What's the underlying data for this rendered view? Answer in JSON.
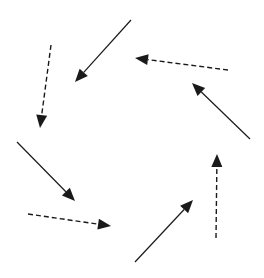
{
  "diagram": {
    "type": "rotational-arrow-field",
    "width": 264,
    "height": 278,
    "stroke_color": "#1a1a1a",
    "background": "#ffffff",
    "arrows": [
      {
        "id": "a1",
        "style": "solid",
        "x1": 131,
        "y1": 20,
        "x2": 75,
        "y2": 82
      },
      {
        "id": "a2",
        "style": "dashed",
        "x1": 51,
        "y1": 45,
        "x2": 40,
        "y2": 128
      },
      {
        "id": "a3",
        "style": "dashed",
        "x1": 228,
        "y1": 70,
        "x2": 135,
        "y2": 58
      },
      {
        "id": "a4",
        "style": "solid",
        "x1": 250,
        "y1": 139,
        "x2": 192,
        "y2": 83
      },
      {
        "id": "a5",
        "style": "solid",
        "x1": 17,
        "y1": 142,
        "x2": 75,
        "y2": 201
      },
      {
        "id": "a6",
        "style": "dashed",
        "x1": 28,
        "y1": 214,
        "x2": 111,
        "y2": 226
      },
      {
        "id": "a7",
        "style": "solid",
        "x1": 135,
        "y1": 262,
        "x2": 193,
        "y2": 200
      },
      {
        "id": "a8",
        "style": "dashed",
        "x1": 216,
        "y1": 238,
        "x2": 217,
        "y2": 154
      }
    ]
  }
}
